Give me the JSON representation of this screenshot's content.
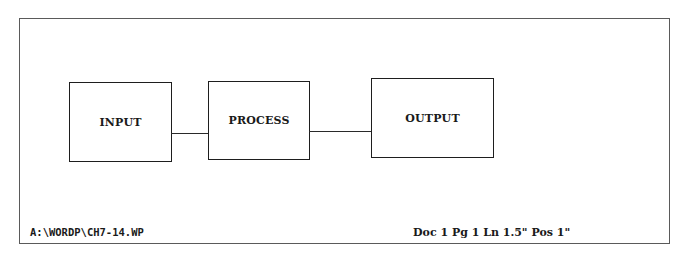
{
  "diagram": {
    "boxes": [
      {
        "id": "input",
        "label": "INPUT"
      },
      {
        "id": "process",
        "label": "PROCESS"
      },
      {
        "id": "output",
        "label": "OUTPUT"
      }
    ],
    "connections": [
      {
        "from": "input",
        "to": "process"
      },
      {
        "from": "process",
        "to": "output"
      }
    ]
  },
  "status_bar": {
    "file_path": "A:\\WORDP\\CH7-14.WP",
    "position": "Doc 1 Pg 1 Ln 1.5\" Pos 1\""
  },
  "colors": {
    "background": "#ffffff",
    "frame": "#5a5a5a",
    "ink": "#1a1a1a"
  }
}
